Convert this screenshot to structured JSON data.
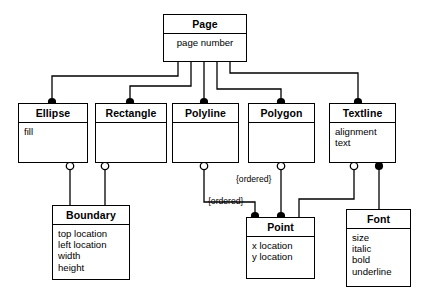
{
  "diagram": {
    "type": "uml-class-diagram",
    "line_color": "#000000",
    "background": "#ffffff",
    "classes": [
      {
        "id": "page",
        "name": "Page",
        "attributes": [
          "page number"
        ]
      },
      {
        "id": "ellipse",
        "name": "Ellipse",
        "attributes": [
          "fill"
        ]
      },
      {
        "id": "rectangle",
        "name": "Rectangle",
        "attributes": []
      },
      {
        "id": "polyline",
        "name": "Polyline",
        "attributes": []
      },
      {
        "id": "polygon",
        "name": "Polygon",
        "attributes": []
      },
      {
        "id": "textline",
        "name": "Textline",
        "attributes": [
          "alignment",
          "text"
        ]
      },
      {
        "id": "boundary",
        "name": "Boundary",
        "attributes": [
          "top location",
          "left location",
          "width",
          "height"
        ]
      },
      {
        "id": "point",
        "name": "Point",
        "attributes": [
          "x location",
          "y location"
        ]
      },
      {
        "id": "font",
        "name": "Font",
        "attributes": [
          "size",
          "italic",
          "bold",
          "underline"
        ]
      }
    ],
    "annotations": [
      {
        "id": "ordered-polygon-point",
        "label": "{ordered}"
      },
      {
        "id": "ordered-polyline-point",
        "label": "{ordered}"
      }
    ],
    "relationships": [
      {
        "from": "page",
        "to": "ellipse",
        "marker": "filled-circle"
      },
      {
        "from": "page",
        "to": "rectangle",
        "marker": "filled-circle"
      },
      {
        "from": "page",
        "to": "polyline",
        "marker": "filled-circle"
      },
      {
        "from": "page",
        "to": "polygon",
        "marker": "filled-circle"
      },
      {
        "from": "page",
        "to": "textline",
        "marker": "filled-circle"
      },
      {
        "from": "ellipse",
        "to": "boundary",
        "marker": "hollow-circle"
      },
      {
        "from": "rectangle",
        "to": "boundary",
        "marker": "hollow-circle"
      },
      {
        "from": "polyline",
        "to": "point",
        "marker": "hollow-circle",
        "constraint": "{ordered}"
      },
      {
        "from": "polygon",
        "to": "point",
        "marker": "hollow-circle",
        "constraint": "{ordered}"
      },
      {
        "from": "textline",
        "to": "point",
        "marker": "hollow-circle"
      },
      {
        "from": "textline",
        "to": "font",
        "marker": "filled-circle"
      }
    ]
  }
}
